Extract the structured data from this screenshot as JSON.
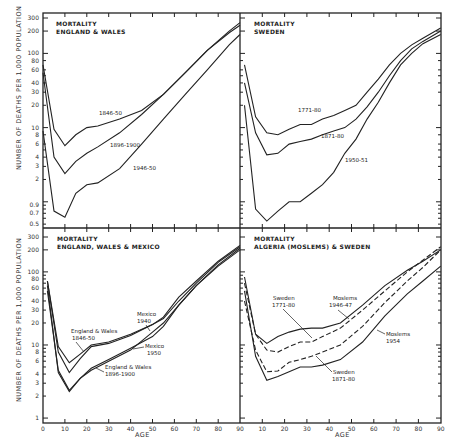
{
  "chart_data": [
    {
      "type": "line",
      "panel": "top-left",
      "title": "MORTALITY\nENGLAND & WALES",
      "xlabel": "",
      "ylabel": "NUMBER OF DEATHS PER 1,000 POPULATION",
      "yscale": "log",
      "ylim": [
        0.5,
        300
      ],
      "xlim": [
        0,
        90
      ],
      "ytick_labels": [
        "300",
        "200",
        "100",
        "80",
        "60",
        "40",
        "30",
        "20",
        "10",
        "8",
        "6",
        "4",
        "3",
        "2",
        "0.9",
        "0.7",
        "0.5"
      ],
      "series": [
        {
          "name": "1846-50",
          "x": [
            0,
            5,
            10,
            15,
            20,
            25,
            35,
            45,
            55,
            65,
            75,
            85,
            90
          ],
          "values": [
            70,
            9.5,
            5.7,
            8,
            10,
            10.5,
            13,
            17,
            28,
            55,
            110,
            200,
            260
          ]
        },
        {
          "name": "1896-1900",
          "x": [
            0,
            5,
            10,
            15,
            20,
            25,
            35,
            45,
            55,
            65,
            75,
            85,
            90
          ],
          "values": [
            55,
            4,
            2.4,
            3.5,
            4.5,
            5.5,
            8.5,
            15,
            28,
            55,
            110,
            190,
            240
          ]
        },
        {
          "name": "1946-50",
          "x": [
            0,
            5,
            10,
            15,
            20,
            25,
            35,
            45,
            55,
            65,
            75,
            85,
            90
          ],
          "values": [
            9,
            0.75,
            0.62,
            1.3,
            1.7,
            1.8,
            2.8,
            6,
            13,
            28,
            60,
            130,
            180
          ]
        }
      ]
    },
    {
      "type": "line",
      "panel": "top-right",
      "title": "MORTALITY\nSWEDEN",
      "yscale": "log",
      "ylim": [
        0.5,
        300
      ],
      "xlim": [
        0,
        90
      ],
      "series": [
        {
          "name": "1771-80",
          "x": [
            2,
            7,
            12,
            17,
            22,
            27,
            32,
            37,
            42,
            47,
            52,
            57,
            62,
            67,
            72,
            77,
            82,
            90
          ],
          "values": [
            70,
            14,
            8.5,
            8,
            9.5,
            11,
            11,
            13,
            14.5,
            17,
            20,
            30,
            45,
            70,
            100,
            130,
            160,
            220
          ]
        },
        {
          "name": "1871-80",
          "x": [
            2,
            7,
            12,
            17,
            22,
            27,
            32,
            37,
            42,
            47,
            52,
            57,
            62,
            67,
            72,
            77,
            82,
            90
          ],
          "values": [
            40,
            8.5,
            4.3,
            4.5,
            6,
            6.5,
            7,
            8,
            9,
            10,
            13,
            19,
            30,
            50,
            80,
            115,
            145,
            200
          ]
        },
        {
          "name": "1950-51",
          "x": [
            2,
            7,
            12,
            17,
            22,
            27,
            32,
            37,
            42,
            47,
            52,
            57,
            62,
            67,
            72,
            77,
            82,
            90
          ],
          "values": [
            20,
            0.8,
            0.55,
            0.75,
            1.0,
            1.0,
            1.3,
            1.7,
            2.5,
            4.5,
            7,
            13,
            22,
            40,
            70,
            100,
            135,
            180
          ]
        }
      ]
    },
    {
      "type": "line",
      "panel": "bottom-left",
      "title": "MORTALITY\nENGLAND, WALES & MEXICO",
      "xlabel": "AGE",
      "ylabel": "NUMBER OF DEATHS PER 1,000 POPULATION",
      "yscale": "log",
      "ylim": [
        1,
        300
      ],
      "xlim": [
        0,
        90
      ],
      "ytick_labels": [
        "300",
        "200",
        "100",
        "80",
        "60",
        "40",
        "30",
        "20",
        "10",
        "8",
        "6",
        "4",
        "3",
        "2",
        "1"
      ],
      "xtick_labels": [
        "0",
        "10",
        "20",
        "30",
        "40",
        "50",
        "60",
        "70",
        "80",
        "90"
      ],
      "series": [
        {
          "name": "England & Wales 1846-50",
          "x": [
            2,
            7,
            12,
            17,
            22,
            30,
            40,
            50,
            55,
            62,
            70,
            80,
            90
          ],
          "values": [
            75,
            9.5,
            5.7,
            7.5,
            10,
            11,
            14,
            19,
            24,
            45,
            75,
            140,
            230
          ]
        },
        {
          "name": "Mexico 1940",
          "x": [
            2,
            7,
            12,
            17,
            22,
            30,
            40,
            50,
            55,
            62,
            70,
            80,
            90
          ],
          "values": [
            75,
            8,
            4.2,
            6.5,
            9.5,
            10.5,
            13.5,
            19,
            23,
            40,
            70,
            135,
            220
          ]
        },
        {
          "name": "Mexico 1950",
          "x": [
            2,
            7,
            12,
            17,
            22,
            30,
            40,
            50,
            55,
            62,
            70,
            80,
            90
          ],
          "values": [
            65,
            4.2,
            2.3,
            3.5,
            4.8,
            6.3,
            9,
            13,
            18,
            35,
            65,
            125,
            210
          ]
        },
        {
          "name": "England & Wales 1896-1900",
          "x": [
            2,
            7,
            12,
            17,
            22,
            30,
            40,
            50,
            55,
            62,
            70,
            80,
            90
          ],
          "values": [
            55,
            4.5,
            2.4,
            3.5,
            4.5,
            6,
            8.5,
            15,
            20,
            35,
            65,
            120,
            200
          ]
        }
      ]
    },
    {
      "type": "line",
      "panel": "bottom-right",
      "title": "MORTALITY\nALGERIA (MOSLEMS) & SWEDEN",
      "xlabel": "AGE",
      "yscale": "log",
      "ylim": [
        1,
        300
      ],
      "xlim": [
        0,
        90
      ],
      "xtick_labels": [
        "10",
        "20",
        "30",
        "40",
        "50",
        "60",
        "70",
        "80",
        "90"
      ],
      "series": [
        {
          "name": "Moslems 1946-47",
          "style": "solid",
          "x": [
            2,
            7,
            12,
            17,
            22,
            27,
            32,
            37,
            45,
            55,
            65,
            75,
            82,
            90
          ],
          "values": [
            85,
            14,
            10.5,
            13,
            15,
            16.5,
            17,
            17,
            20,
            35,
            65,
            105,
            140,
            200
          ]
        },
        {
          "name": "Sweden 1771-80",
          "style": "dashed",
          "x": [
            2,
            7,
            12,
            17,
            22,
            27,
            32,
            37,
            45,
            55,
            65,
            75,
            82,
            90
          ],
          "values": [
            70,
            14,
            8.5,
            8,
            9.5,
            11,
            11,
            13,
            17,
            30,
            55,
            100,
            145,
            220
          ]
        },
        {
          "name": "Sweden 1871-80",
          "style": "dashed",
          "x": [
            2,
            7,
            12,
            17,
            22,
            27,
            32,
            37,
            45,
            55,
            65,
            75,
            82,
            90
          ],
          "values": [
            40,
            8.5,
            4.3,
            4.4,
            5.8,
            6.3,
            7,
            8,
            10,
            18,
            38,
            75,
            115,
            200
          ]
        },
        {
          "name": "Moslems 1954",
          "style": "solid",
          "x": [
            2,
            7,
            12,
            17,
            22,
            27,
            32,
            37,
            45,
            55,
            65,
            75,
            82,
            90
          ],
          "values": [
            55,
            7,
            3.3,
            3.7,
            4.3,
            5,
            5,
            5.3,
            6.3,
            11,
            25,
            50,
            75,
            120
          ]
        }
      ]
    }
  ],
  "panels": [
    {
      "title_line1": "MORTALITY",
      "title_line2": "ENGLAND & WALES",
      "annotations": [
        {
          "text": "1846-50"
        },
        {
          "text": "1896-1900"
        },
        {
          "text": "1946-50"
        }
      ]
    },
    {
      "title_line1": "MORTALITY",
      "title_line2": "SWEDEN",
      "annotations": [
        {
          "text": "1771-80"
        },
        {
          "text": "1871-80"
        },
        {
          "text": "1950-51"
        }
      ]
    },
    {
      "title_line1": "MORTALITY",
      "title_line2": "ENGLAND, WALES & MEXICO",
      "annotations": [
        {
          "text1": "England & Wales",
          "text2": "1846-50"
        },
        {
          "text1": "Mexico",
          "text2": "1940"
        },
        {
          "text1": "Mexico",
          "text2": "1950"
        },
        {
          "text1": "England & Wales",
          "text2": "1896-1900"
        }
      ]
    },
    {
      "title_line1": "MORTALITY",
      "title_line2": "ALGERIA (MOSLEMS) & SWEDEN",
      "annotations": [
        {
          "text1": "Sweden",
          "text2": "1771-80"
        },
        {
          "text1": "Moslems",
          "text2": "1946-47"
        },
        {
          "text1": "Moslems",
          "text2": "1954"
        },
        {
          "text1": "Sweden",
          "text2": "1871-80"
        }
      ]
    }
  ],
  "axes": {
    "ylabel_top": "NUMBER OF DEATHS PER 1,000 POPULATION",
    "ylabel_bottom": "NUMBER OF DEATHS PER 1,000 POPULATION",
    "xlabel_left": "AGE",
    "xlabel_right": "AGE"
  }
}
